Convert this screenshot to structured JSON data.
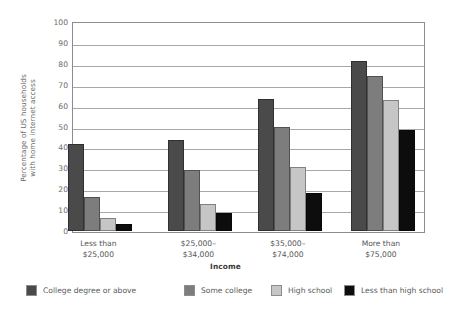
{
  "chart_data": {
    "type": "bar",
    "title": "",
    "xlabel": "Income",
    "ylabel": "Percentage of US households with home internet access",
    "ylabel_line1": "Percentage of US households",
    "ylabel_line2": "with home internet access",
    "ylim": [
      0,
      100
    ],
    "ytick_step": 10,
    "yticks": [
      "100",
      "90",
      "80",
      "70",
      "60",
      "50",
      "40",
      "30",
      "20",
      "10",
      "0"
    ],
    "grid": true,
    "legend_position": "bottom",
    "categories": [
      "Less than $25,000",
      "$25,000–$34,000",
      "$35,000–$74,000",
      "More than $75,000"
    ],
    "category_lines": [
      [
        "Less than",
        "$25,000"
      ],
      [
        "$25,000–",
        "$34,000"
      ],
      [
        "$35,000–",
        "$74,000"
      ],
      [
        "More than",
        "$75,000"
      ]
    ],
    "series": [
      {
        "name": "College degree or above",
        "color": "#4a4a4a",
        "values": [
          41.5,
          43.5,
          63,
          81.5
        ]
      },
      {
        "name": "Some college",
        "color": "#7d7d7d",
        "values": [
          16.5,
          29,
          50,
          74
        ]
      },
      {
        "name": "High school",
        "color": "#c6c6c6",
        "values": [
          6,
          13,
          30.5,
          62.5
        ]
      },
      {
        "name": "Less than high school",
        "color": "#0d0d0d",
        "values": [
          3.5,
          8.5,
          18,
          48.5
        ]
      }
    ]
  },
  "legend": {
    "items": [
      {
        "label": "College degree or above",
        "color": "#4a4a4a"
      },
      {
        "label": "Some college",
        "color": "#7d7d7d"
      },
      {
        "label": "High school",
        "color": "#c6c6c6"
      },
      {
        "label": "Less than high school",
        "color": "#0d0d0d"
      }
    ]
  },
  "colors": {
    "frame": "#8c8c8c",
    "grid": "#a8a8a8",
    "axis_text": "#6b6b6b",
    "background": "#ffffff"
  }
}
